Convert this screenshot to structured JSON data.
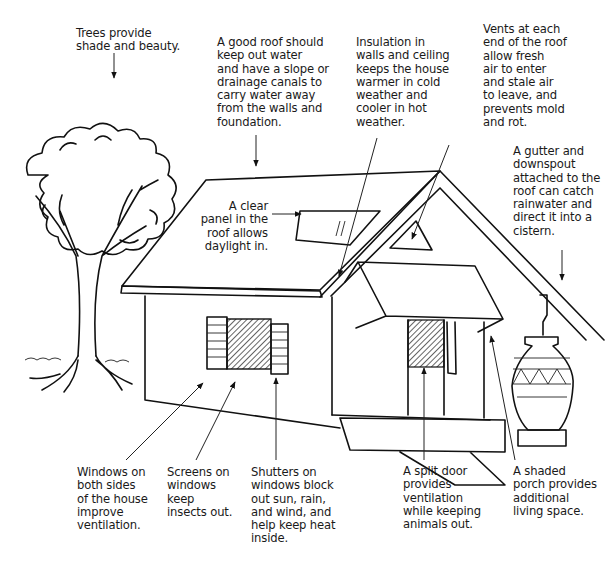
{
  "diagram": {
    "labels": {
      "trees": "Trees provide\nshade and beauty.",
      "roof": "A good roof should\nkeep out water\nand have a slope or\ndrainage canals to\ncarry water away\nfrom the walls and\nfoundation.",
      "insulation": "Insulation in\nwalls and ceiling\nkeeps the house\nwarmer in cold\nweather and\ncooler in hot\nweather.",
      "vents": "Vents at each\nend of the roof\nallow fresh\nair to enter\nand stale air\nto leave, and\nprevents mold\nand rot.",
      "gutter": "A gutter and\ndownspout\nattached to the\nroof can catch\nrainwater and\ndirect it into a\ncistern.",
      "clear_panel": "A clear\npanel in the\nroof allows\ndaylight in.",
      "windows": "Windows on\nboth sides\nof the house\nimprove\nventilation.",
      "screens": "Screens on\nwindows\nkeep\ninsects out.",
      "shutters": "Shutters on\nwindows block\nout sun, rain,\nand wind, and\nhelp keep heat\ninside.",
      "split_door": "A split door\nprovides\nventilation\nwhile keeping\nanimals out.",
      "porch": "A shaded\nporch provides\nadditional\nliving space."
    },
    "elements": [
      "tree",
      "house",
      "roof",
      "skylight",
      "gable-vent",
      "window-with-shutters",
      "split-door",
      "porch-awning",
      "gutter-downspout",
      "cistern-jar",
      "steps"
    ],
    "colors": {
      "ink": "#111111",
      "background": "#ffffff"
    }
  }
}
